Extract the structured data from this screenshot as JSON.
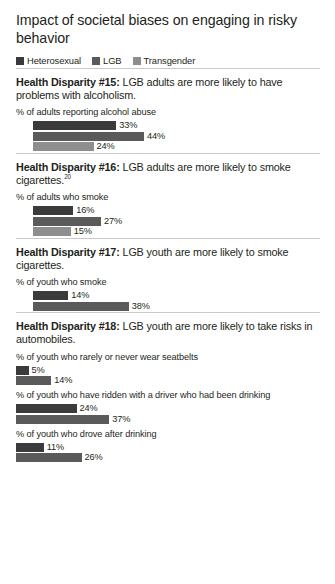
{
  "chart_data": {
    "type": "bar",
    "title": "Impact of societal biases on engaging in risky behavior",
    "orientation": "horizontal",
    "xlabel": "",
    "ylabel": "",
    "grid": false,
    "legend_position": "top",
    "value_suffix": "%",
    "colors": {
      "Heterosexual": "#3b3b3b",
      "LGB": "#5a5a5a",
      "Transgender": "#8e8e8e"
    },
    "legend": [
      {
        "label": "Heterosexual",
        "color": "#3b3b3b"
      },
      {
        "label": "LGB",
        "color": "#5a5a5a"
      },
      {
        "label": "Transgender",
        "color": "#8e8e8e"
      }
    ],
    "series": [
      {
        "name": "Heterosexual",
        "values": [
          33,
          16,
          14,
          5,
          24,
          11
        ]
      },
      {
        "name": "LGB",
        "values": [
          44,
          27,
          38,
          14,
          37,
          26
        ]
      },
      {
        "name": "Transgender",
        "values": [
          24,
          15,
          null,
          null,
          null,
          null
        ]
      }
    ],
    "categories": [
      "% of adults reporting alcohol abuse",
      "% of adults who smoke",
      "% of youth who smoke",
      "% of youth who rarely or never wear seatbelts",
      "% of youth who have ridden with a driver who had been drinking",
      "% of youth who drove after drinking"
    ],
    "xlim": [
      0,
      50
    ]
  },
  "sections": [
    {
      "heading_label": "Health Disparity #15:",
      "heading_text": " LGB adults are more likely to have problems with alcoholism.",
      "footnote": "",
      "indent": true,
      "groups": [
        {
          "label": "% of adults reporting alcohol abuse",
          "bars": [
            {
              "series": "Heterosexual",
              "value": 33,
              "value_text": "33%",
              "color": "#3b3b3b"
            },
            {
              "series": "LGB",
              "value": 44,
              "value_text": "44%",
              "color": "#5a5a5a"
            },
            {
              "series": "Transgender",
              "value": 24,
              "value_text": "24%",
              "color": "#8e8e8e"
            }
          ]
        }
      ]
    },
    {
      "heading_label": "Health Disparity #16:",
      "heading_text": " LGB adults are more likely to smoke cigarettes.",
      "footnote": "20",
      "indent": true,
      "groups": [
        {
          "label": "% of adults who smoke",
          "bars": [
            {
              "series": "Heterosexual",
              "value": 16,
              "value_text": "16%",
              "color": "#3b3b3b"
            },
            {
              "series": "LGB",
              "value": 27,
              "value_text": "27%",
              "color": "#5a5a5a"
            },
            {
              "series": "Transgender",
              "value": 15,
              "value_text": "15%",
              "color": "#8e8e8e"
            }
          ]
        }
      ]
    },
    {
      "heading_label": "Health Disparity #17:",
      "heading_text": " LGB youth are more likely to smoke cigarettes.",
      "footnote": "",
      "indent": true,
      "groups": [
        {
          "label": "% of youth who smoke",
          "bars": [
            {
              "series": "Heterosexual",
              "value": 14,
              "value_text": "14%",
              "color": "#3b3b3b"
            },
            {
              "series": "LGB",
              "value": 38,
              "value_text": "38%",
              "color": "#5a5a5a"
            }
          ]
        }
      ]
    },
    {
      "heading_label": "Health Disparity #18:",
      "heading_text": " LGB youth are more likely to take risks in automobiles.",
      "footnote": "",
      "indent": false,
      "groups": [
        {
          "label": "% of youth who rarely or never wear seatbelts",
          "bars": [
            {
              "series": "Heterosexual",
              "value": 5,
              "value_text": "5%",
              "color": "#3b3b3b"
            },
            {
              "series": "LGB",
              "value": 14,
              "value_text": "14%",
              "color": "#5a5a5a"
            }
          ]
        },
        {
          "label": "% of youth who have ridden with a driver who had been drinking",
          "bars": [
            {
              "series": "Heterosexual",
              "value": 24,
              "value_text": "24%",
              "color": "#3b3b3b"
            },
            {
              "series": "LGB",
              "value": 37,
              "value_text": "37%",
              "color": "#5a5a5a"
            }
          ]
        },
        {
          "label": "% of youth who drove after drinking",
          "bars": [
            {
              "series": "Heterosexual",
              "value": 11,
              "value_text": "11%",
              "color": "#3b3b3b"
            },
            {
              "series": "LGB",
              "value": 26,
              "value_text": "26%",
              "color": "#5a5a5a"
            }
          ]
        }
      ]
    }
  ],
  "scale": {
    "px_per_percent": 2.52
  }
}
